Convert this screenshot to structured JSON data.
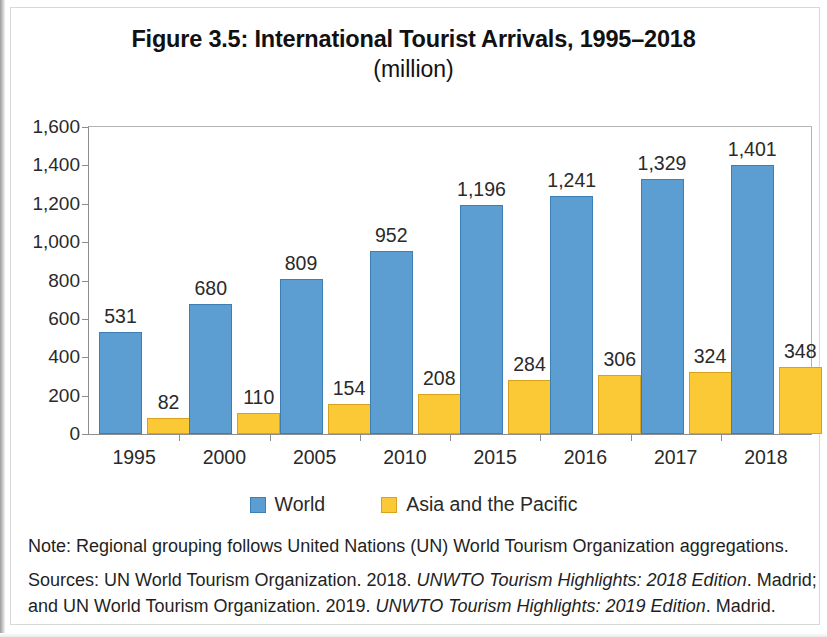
{
  "figure": {
    "title": "Figure 3.5: International Tourist Arrivals, 1995–2018",
    "subtitle": "(million)"
  },
  "legend": {
    "items": [
      {
        "label": "World",
        "color": "#5d9ed2"
      },
      {
        "label": "Asia and the Pacific",
        "color": "#fbc836"
      }
    ]
  },
  "footnotes": {
    "note": "Note: Regional grouping follows United Nations (UN) World Tourism Organization aggregations.",
    "sources_line1_pre": "Sources: UN World Tourism Organization. 2018. ",
    "sources_line1_italic": "UNWTO Tourism Highlights: 2018 Edition",
    "sources_line1_post": ". Madrid;",
    "sources_line2_pre": "and UN World Tourism Organization. 2019. ",
    "sources_line2_italic": "UNWTO Tourism Highlights: 2019 Edition",
    "sources_line2_post": ". Madrid."
  },
  "chart_data": {
    "type": "bar",
    "title": "Figure 3.5: International Tourist Arrivals, 1995–2018",
    "subtitle": "(million)",
    "xlabel": "",
    "ylabel": "",
    "ylim": [
      0,
      1600
    ],
    "ytick_values": [
      0,
      200,
      400,
      600,
      800,
      1000,
      1200,
      1400,
      1600
    ],
    "ytick_labels": [
      "0",
      "200",
      "400",
      "600",
      "800",
      "1,000",
      "1,200",
      "1,400",
      "1,600"
    ],
    "grid": false,
    "legend_position": "bottom",
    "categories": [
      "1995",
      "2000",
      "2005",
      "2010",
      "2015",
      "2016",
      "2017",
      "2018"
    ],
    "series": [
      {
        "name": "World",
        "color": "#5d9ed2",
        "values": [
          531,
          680,
          809,
          952,
          1196,
          1241,
          1329,
          1401
        ],
        "labels": [
          "531",
          "680",
          "809",
          "952",
          "1,196",
          "1,241",
          "1,329",
          "1,401"
        ]
      },
      {
        "name": "Asia and the Pacific",
        "color": "#fbc836",
        "values": [
          82,
          110,
          154,
          208,
          284,
          306,
          324,
          348
        ],
        "labels": [
          "82",
          "110",
          "154",
          "208",
          "284",
          "306",
          "324",
          "348"
        ]
      }
    ]
  }
}
